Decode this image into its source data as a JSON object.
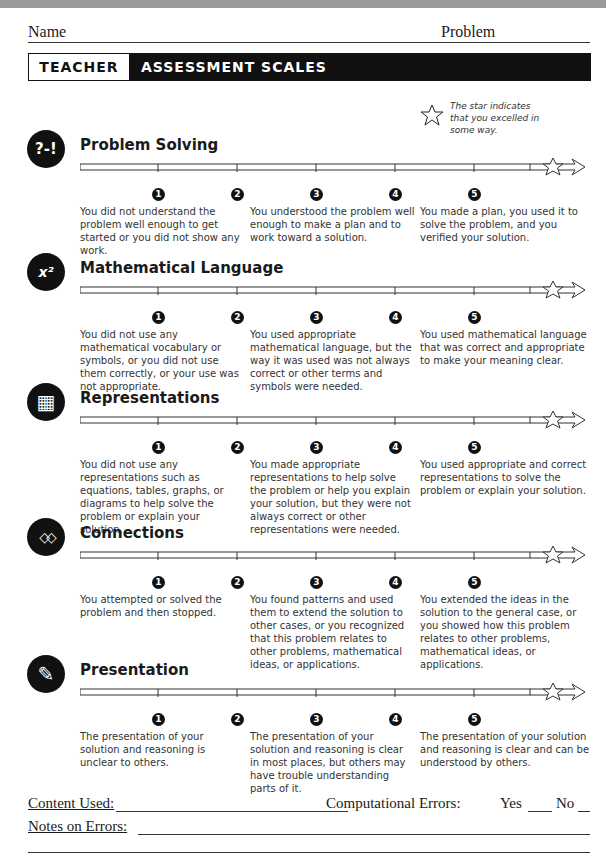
{
  "header": {
    "name_label": "Name",
    "problem_label": "Problem"
  },
  "banner": {
    "left": "TEACHER",
    "title": "ASSESSMENT SCALES"
  },
  "star_note": "The star indicates that you excelled in some way.",
  "numbers": [
    "1",
    "2",
    "3",
    "4",
    "5"
  ],
  "sections": [
    {
      "title": "Problem Solving",
      "icon": "?-!",
      "desc": [
        "You did not understand the problem well enough to get started or you did not show any work.",
        "You understood the problem well enough to make a plan and to work toward a solution.",
        "You made a plan, you used it to solve the problem, and you verified your solution."
      ]
    },
    {
      "title": "Mathematical Language",
      "icon": "x²",
      "desc": [
        "You did not use any mathematical vocabulary or symbols, or you did not use them correctly, or your use was not appropriate.",
        "You used appropriate mathematical language, but the way it was used was not always correct or other terms and symbols were needed.",
        "You used mathematical language that was correct and appropriate to make your meaning clear."
      ]
    },
    {
      "title": "Representations",
      "icon": "▦",
      "desc": [
        "You did not use any representations such as equations, tables, graphs, or diagrams to help solve the problem or explain your solution.",
        "You made appropriate representations to help solve the problem or help you explain your solution, but they were not always correct or other representations were needed.",
        "You used appropriate and correct representations to solve the problem or explain your solution."
      ]
    },
    {
      "title": "Connections",
      "icon": "◇◇",
      "desc": [
        "You attempted or solved the problem and then stopped.",
        "You found patterns and used them to extend the solution to other cases, or you recognized that this problem relates to other problems, mathematical ideas, or applications.",
        "You extended the ideas in the solution to the general case, or you showed how this problem relates to other problems, mathematical ideas, or applications."
      ]
    },
    {
      "title": "Presentation",
      "icon": "✎",
      "desc": [
        "The presentation of your solution and reasoning is unclear to others.",
        "The presentation of your solution and reasoning is clear in most places, but others may have trouble understanding parts of it.",
        "The presentation of your solution and reasoning is clear and can be understood by others."
      ]
    }
  ],
  "footer": {
    "content_used": "Content Used:",
    "computational_errors": "Computational Errors:",
    "yes": "Yes",
    "no": "No",
    "notes": "Notes on Errors:"
  }
}
